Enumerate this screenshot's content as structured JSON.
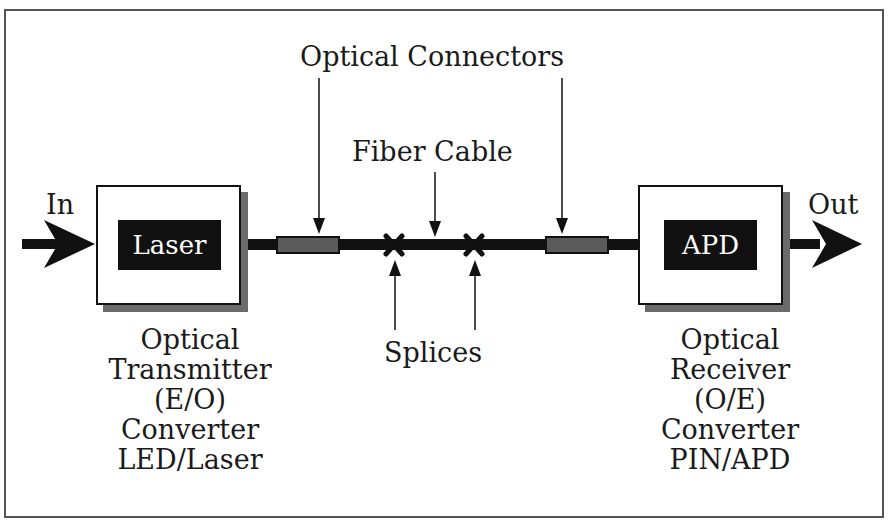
{
  "diagram": {
    "title_labels": {
      "optical_connectors": "Optical Connectors",
      "fiber_cable": "Fiber Cable",
      "splices": "Splices",
      "input": "In",
      "output": "Out"
    },
    "transmitter": {
      "chip_label": "Laser",
      "caption": [
        "Optical",
        "Transmitter",
        "(E/O)",
        "Converter",
        "LED/Laser"
      ]
    },
    "receiver": {
      "chip_label": "APD",
      "caption": [
        "Optical",
        "Receiver",
        "(O/E)",
        "Converter",
        "PIN/APD"
      ]
    },
    "colors": {
      "line": "#111111",
      "connector": "#555555",
      "shadow": "#6b6b6b",
      "frame": "#555555"
    }
  }
}
